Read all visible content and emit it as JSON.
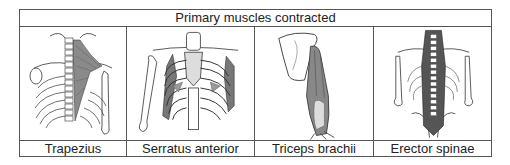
{
  "table": {
    "title": "Primary muscles contracted",
    "muscles": [
      {
        "label": "Trapezius",
        "icon": "trapezius-back-illustration"
      },
      {
        "label": "Serratus anterior",
        "icon": "serratus-ribcage-illustration"
      },
      {
        "label": "Triceps brachii",
        "icon": "triceps-arm-illustration"
      },
      {
        "label": "Erector spinae",
        "icon": "erector-spine-illustration"
      }
    ]
  },
  "colors": {
    "border": "#555555",
    "muscle_fill": "#8a8a8a",
    "bone_fill": "#ffffff",
    "line": "#333333"
  }
}
